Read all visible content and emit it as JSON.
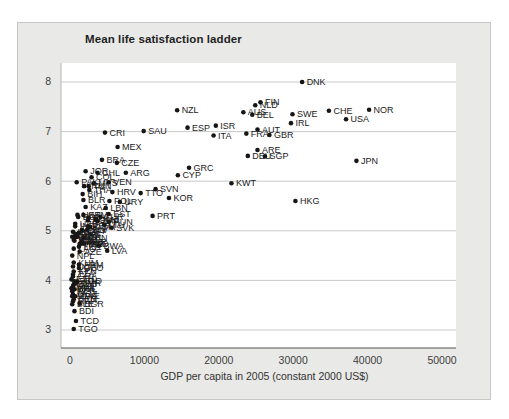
{
  "chart_data": {
    "type": "scatter",
    "title": "Mean life satisfaction ladder",
    "xlabel": "GDP per capita in 2005 (constant 2000 US$)",
    "ylabel": "Mean life satisfaction ladder",
    "xlim": [
      -1210,
      51882
    ],
    "ylim": [
      2.637,
      8.383
    ],
    "x_ticks": [
      0,
      10000,
      20000,
      30000,
      40000,
      50000
    ],
    "y_ticks": [
      3,
      4,
      5,
      6,
      7,
      8
    ],
    "grid": "horizontal",
    "legend": "none",
    "colors": {
      "dot": "#161616",
      "label": "#1a1a1a",
      "gridline": "#c9c9c9",
      "left_spine": "#b5b5b5",
      "bottom_spine": "#555555",
      "tick_text": "#3d3d3d",
      "plot_bg": "#ffffff",
      "card_bg": "#e9e9e7"
    },
    "points": [
      {
        "label": "DNK",
        "x": 31200,
        "y": 8.0
      },
      {
        "label": "FIN",
        "x": 25600,
        "y": 7.59
      },
      {
        "label": "NLD",
        "x": 24900,
        "y": 7.53
      },
      {
        "label": "AUS",
        "x": 23300,
        "y": 7.39
      },
      {
        "label": "BEL",
        "x": 24500,
        "y": 7.34
      },
      {
        "label": "NZL",
        "x": 14400,
        "y": 7.43
      },
      {
        "label": "SWE",
        "x": 29900,
        "y": 7.35
      },
      {
        "label": "CHE",
        "x": 34800,
        "y": 7.42
      },
      {
        "label": "NOR",
        "x": 40200,
        "y": 7.44
      },
      {
        "label": "USA",
        "x": 37100,
        "y": 7.25
      },
      {
        "label": "IRL",
        "x": 29700,
        "y": 7.17
      },
      {
        "label": "ISR",
        "x": 19600,
        "y": 7.12
      },
      {
        "label": "ESP",
        "x": 15800,
        "y": 7.08
      },
      {
        "label": "SAU",
        "x": 9900,
        "y": 7.01
      },
      {
        "label": "CRI",
        "x": 4700,
        "y": 6.98
      },
      {
        "label": "AUT",
        "x": 25200,
        "y": 7.04
      },
      {
        "label": "ITA",
        "x": 19300,
        "y": 6.92
      },
      {
        "label": "FRA",
        "x": 23700,
        "y": 6.96
      },
      {
        "label": "GBR",
        "x": 26800,
        "y": 6.93
      },
      {
        "label": "MEX",
        "x": 6400,
        "y": 6.69
      },
      {
        "label": "ARE",
        "x": 25200,
        "y": 6.63
      },
      {
        "label": "DEU",
        "x": 23900,
        "y": 6.51
      },
      {
        "label": "SGP",
        "x": 26200,
        "y": 6.5
      },
      {
        "label": "JPN",
        "x": 38500,
        "y": 6.41
      },
      {
        "label": "BRA",
        "x": 4300,
        "y": 6.43
      },
      {
        "label": "CZE",
        "x": 6300,
        "y": 6.37
      },
      {
        "label": "GRC",
        "x": 16000,
        "y": 6.27
      },
      {
        "label": "JOR",
        "x": 2100,
        "y": 6.2
      },
      {
        "label": "CHL",
        "x": 3700,
        "y": 6.17
      },
      {
        "label": "ARG",
        "x": 7500,
        "y": 6.17
      },
      {
        "label": "CYP",
        "x": 14500,
        "y": 6.12
      },
      {
        "label": "COL",
        "x": 2900,
        "y": 6.08
      },
      {
        "label": "PAK",
        "x": 900,
        "y": 5.98
      },
      {
        "label": "MYS",
        "x": 3200,
        "y": 5.96
      },
      {
        "label": "KWT",
        "x": 21700,
        "y": 5.96
      },
      {
        "label": "VEN",
        "x": 5200,
        "y": 5.98
      },
      {
        "label": "IRN",
        "x": 1900,
        "y": 5.9
      },
      {
        "label": "TUN",
        "x": 2500,
        "y": 5.9
      },
      {
        "label": "SVN",
        "x": 11500,
        "y": 5.84
      },
      {
        "label": "THA",
        "x": 2600,
        "y": 5.82
      },
      {
        "label": "HRV",
        "x": 5700,
        "y": 5.78
      },
      {
        "label": "TTO",
        "x": 9500,
        "y": 5.76
      },
      {
        "label": "BIH",
        "x": 1700,
        "y": 5.74
      },
      {
        "label": "KOR",
        "x": 13300,
        "y": 5.66
      },
      {
        "label": "HKG",
        "x": 30300,
        "y": 5.6
      },
      {
        "label": "BLR",
        "x": 1800,
        "y": 5.62
      },
      {
        "label": "URY",
        "x": 6700,
        "y": 5.58
      },
      {
        "label": "POL",
        "x": 5300,
        "y": 5.6
      },
      {
        "label": "KAZ",
        "x": 2100,
        "y": 5.48
      },
      {
        "label": "LBN",
        "x": 4800,
        "y": 5.46
      },
      {
        "label": "EST",
        "x": 5200,
        "y": 5.34
      },
      {
        "label": "PRT",
        "x": 11100,
        "y": 5.3
      },
      {
        "label": "HUN",
        "x": 5200,
        "y": 5.18
      },
      {
        "label": "SVK",
        "x": 5600,
        "y": 5.06
      },
      {
        "label": "LTU",
        "x": 4600,
        "y": 5.12
      },
      {
        "label": "LVA",
        "x": 5000,
        "y": 4.6
      },
      {
        "label": "BWA",
        "x": 3900,
        "y": 4.7
      },
      {
        "label": "UKR",
        "x": 1000,
        "y": 5.32
      },
      {
        "label": "RUS",
        "x": 2500,
        "y": 5.26
      },
      {
        "label": "ROU",
        "x": 2400,
        "y": 5.21
      },
      {
        "label": "TUR",
        "x": 4100,
        "y": 5.28
      },
      {
        "label": "ZAF",
        "x": 3700,
        "y": 5.19
      },
      {
        "label": "PER",
        "x": 2400,
        "y": 5.09
      },
      {
        "label": "PHL",
        "x": 1200,
        "y": 4.96
      },
      {
        "label": "IDN",
        "x": 1000,
        "y": 4.88
      },
      {
        "label": "CHN",
        "x": 1800,
        "y": 4.86
      },
      {
        "label": "ALB",
        "x": 1600,
        "y": 4.78
      },
      {
        "label": "MKD",
        "x": 1900,
        "y": 4.74
      },
      {
        "label": "GEO",
        "x": 1200,
        "y": 4.25
      },
      {
        "label": "ARM",
        "x": 1200,
        "y": 4.32
      },
      {
        "label": "AZE",
        "x": 1300,
        "y": 4.58
      },
      {
        "label": "MDA",
        "x": 800,
        "y": 4.88
      },
      {
        "label": "EGY",
        "x": 1700,
        "y": 5.0
      },
      {
        "label": "MAR",
        "x": 1600,
        "y": 4.78
      },
      {
        "label": "IND",
        "x": 700,
        "y": 5.09
      },
      {
        "label": "BGD",
        "x": 500,
        "y": 4.82
      },
      {
        "label": "NPL",
        "x": 300,
        "y": 4.5
      },
      {
        "label": "LKA",
        "x": 1200,
        "y": 4.68
      },
      {
        "label": "KHM",
        "x": 500,
        "y": 4.36
      },
      {
        "label": "LAO",
        "x": 500,
        "y": 4.64
      },
      {
        "label": "NGA",
        "x": 600,
        "y": 4.8
      },
      {
        "label": "KEN",
        "x": 500,
        "y": 4.18
      },
      {
        "label": "UGA",
        "x": 400,
        "y": 4.28
      },
      {
        "label": "TZA",
        "x": 400,
        "y": 4.12
      },
      {
        "label": "ETH",
        "x": 200,
        "y": 4.02
      },
      {
        "label": "GHA",
        "x": 400,
        "y": 4.08
      },
      {
        "label": "SEN",
        "x": 600,
        "y": 3.98
      },
      {
        "label": "MLI",
        "x": 400,
        "y": 3.88
      },
      {
        "label": "BFA",
        "x": 400,
        "y": 3.82
      },
      {
        "label": "NER",
        "x": 300,
        "y": 3.78
      },
      {
        "label": "MWI",
        "x": 200,
        "y": 3.84
      },
      {
        "label": "ZMB",
        "x": 500,
        "y": 3.92
      },
      {
        "label": "MOZ",
        "x": 400,
        "y": 3.72
      },
      {
        "label": "AGO",
        "x": 1000,
        "y": 3.98
      },
      {
        "label": "CMR",
        "x": 800,
        "y": 3.94
      },
      {
        "label": "MDG",
        "x": 300,
        "y": 3.68
      },
      {
        "label": "RWA",
        "x": 400,
        "y": 3.58
      },
      {
        "label": "SLE",
        "x": 300,
        "y": 3.52
      },
      {
        "label": "BEN",
        "x": 500,
        "y": 3.62
      },
      {
        "label": "HTI",
        "x": 600,
        "y": 3.82
      },
      {
        "label": "ZWE",
        "x": 700,
        "y": 3.68
      },
      {
        "label": "KGZ",
        "x": 400,
        "y": 4.98
      },
      {
        "label": "UZB",
        "x": 700,
        "y": 5.14
      },
      {
        "label": "TJK",
        "x": 300,
        "y": 4.88
      },
      {
        "label": "MNG",
        "x": 700,
        "y": 4.94
      },
      {
        "label": "BOL",
        "x": 1100,
        "y": 5.28
      },
      {
        "label": "ECU",
        "x": 1600,
        "y": 5.02
      },
      {
        "label": "PRY",
        "x": 1500,
        "y": 4.74
      },
      {
        "label": "NIC",
        "x": 900,
        "y": 4.88
      },
      {
        "label": "HND",
        "x": 1300,
        "y": 4.74
      },
      {
        "label": "SLV",
        "x": 2300,
        "y": 5.02
      },
      {
        "label": "DOM",
        "x": 2700,
        "y": 5.08
      },
      {
        "label": "GTM",
        "x": 1800,
        "y": 5.32
      },
      {
        "label": "JAM",
        "x": 3500,
        "y": 5.22
      },
      {
        "label": "BGR",
        "x": 1300,
        "y": 3.53
      },
      {
        "label": "BDI",
        "x": 600,
        "y": 3.38
      },
      {
        "label": "TCD",
        "x": 800,
        "y": 3.18
      },
      {
        "label": "TGO",
        "x": 500,
        "y": 3.02
      }
    ]
  }
}
